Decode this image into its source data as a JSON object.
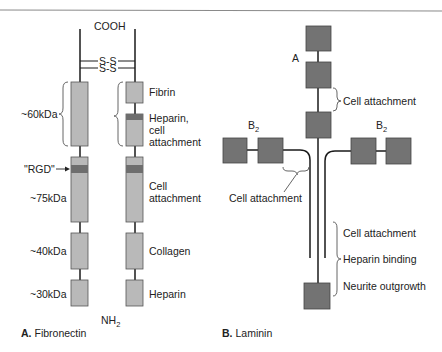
{
  "colors": {
    "light_box": "#b9b9b9",
    "dark_band": "#6e6e6e",
    "laminin_box": "#737373",
    "line": "#1a1a1a",
    "rule": "#8a8a8a",
    "brace": "#555555"
  },
  "fibronectin": {
    "caption_letter": "A.",
    "caption_name": "Fibronectin",
    "top_label": "COOH",
    "bottom_label_main": "NH",
    "bottom_label_sub": "2",
    "disulfide_1": "S-S",
    "disulfide_2": "S-S",
    "rgd_label": "\"RGD\"",
    "left_fragments": [
      {
        "label": "~60kDa"
      },
      {
        "label": "~75kDa"
      },
      {
        "label": "~40kDa"
      },
      {
        "label": "~30kDa"
      }
    ],
    "right_domains": [
      {
        "label": "Fibrin"
      },
      {
        "label_lines": [
          "Heparin,",
          "cell",
          "attachment"
        ]
      },
      {
        "label_lines": [
          "Cell",
          "attachment"
        ]
      },
      {
        "label": "Collagen"
      },
      {
        "label": "Heparin"
      }
    ]
  },
  "laminin": {
    "caption_letter": "B.",
    "caption_name": "Laminin",
    "chain_a_label": "A",
    "chain_b2_left_main": "B",
    "chain_b2_left_sub": "2",
    "chain_b2_right_main": "B",
    "chain_b2_right_sub": "2",
    "upper_annotation": "Cell attachment",
    "left_annotation": "Cell attachment",
    "lower_annotations": [
      "Cell attachment",
      "Heparin binding",
      "Neurite outgrowth"
    ]
  }
}
